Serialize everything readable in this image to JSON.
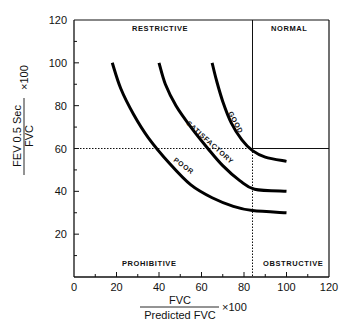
{
  "chart_data": {
    "type": "line",
    "title": "",
    "xlabel": {
      "numerator": "FVC",
      "denominator": "Predicted FVC",
      "multiplier": "×100"
    },
    "ylabel": {
      "numerator": "FEV 0.5 Sec",
      "denominator": "FVC",
      "multiplier": "×100"
    },
    "xlim": [
      0,
      120
    ],
    "ylim": [
      0,
      120
    ],
    "x_ticks": [
      0,
      20,
      40,
      60,
      80,
      100,
      120
    ],
    "y_ticks": [
      20,
      40,
      60,
      80,
      100,
      120
    ],
    "x_tick_labels": [
      "0",
      "20",
      "40",
      "60",
      "80",
      "100",
      "120"
    ],
    "y_tick_labels": [
      "20",
      "40",
      "60",
      "80",
      "100",
      "120"
    ],
    "grid": false,
    "regions": [
      {
        "label": "RESTRICTIVE",
        "position": "top-left"
      },
      {
        "label": "NORMAL",
        "position": "top-right"
      },
      {
        "label": "PROHIBITIVE",
        "position": "bottom-left"
      },
      {
        "label": "OBSTRUCTIVE",
        "position": "bottom-right"
      }
    ],
    "dividers": {
      "horizontal_y": 60,
      "vertical_x": 84,
      "style": "solid in NORMAL boundary, dotted elsewhere"
    },
    "series": [
      {
        "name": "POOR",
        "x": [
          18,
          22,
          28,
          35,
          45,
          55,
          65,
          75,
          84,
          100
        ],
        "y": [
          100,
          88,
          76,
          65,
          53,
          43,
          37,
          33,
          31,
          30
        ]
      },
      {
        "name": "SATISFACTORY",
        "x": [
          40,
          43,
          48,
          55,
          63,
          70,
          78,
          85,
          100
        ],
        "y": [
          100,
          90,
          80,
          70,
          60,
          52,
          45,
          41,
          40
        ]
      },
      {
        "name": "GOOD",
        "x": [
          65,
          67,
          70,
          74,
          79,
          84,
          90,
          100
        ],
        "y": [
          100,
          92,
          82,
          72,
          64,
          59,
          56,
          54
        ]
      }
    ]
  },
  "labels": {
    "restrictive": "RESTRICTIVE",
    "normal": "NORMAL",
    "prohibitive": "PROHIBITIVE",
    "obstructive": "OBSTRUCTIVE",
    "poor": "POOR",
    "satisfactory": "SATISFACTORY",
    "good": "GOOD"
  }
}
